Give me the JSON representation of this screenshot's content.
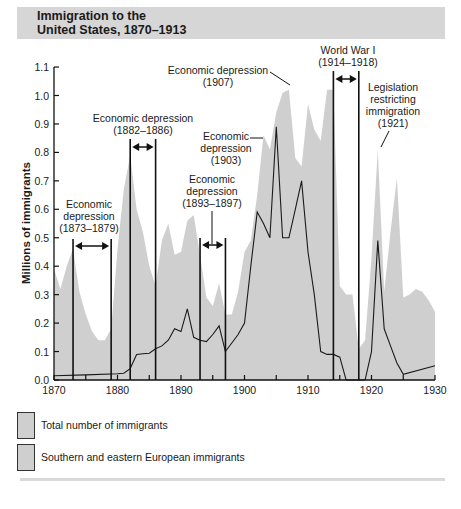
{
  "title": {
    "line1": "Immigration to the",
    "line2": "United States, 1870–1913"
  },
  "colors": {
    "total_fill": "#cfcfcf",
    "title_bar": "#d6d6d6",
    "line": "#1a1a1a"
  },
  "chart_data": {
    "type": "area",
    "title": "Immigration to the United States, 1870–1913",
    "xlabel": "",
    "ylabel": "Millions of immigrants",
    "xlim": [
      1870,
      1930
    ],
    "ylim": [
      0.0,
      1.1
    ],
    "x_ticks": [
      "1870",
      "1880",
      "1890",
      "1900",
      "1910",
      "1920",
      "1930"
    ],
    "y_ticks": [
      "0.0",
      "0.1",
      "0.2",
      "0.3",
      "0.4",
      "0.5",
      "0.6",
      "0.7",
      "0.8",
      "0.9",
      "1.0",
      "1.1"
    ],
    "grid": false,
    "legend_position": "bottom",
    "series": [
      {
        "name": "Total number of immigrants",
        "style": "area",
        "x": [
          1870,
          1871,
          1872,
          1873,
          1874,
          1875,
          1876,
          1877,
          1878,
          1879,
          1880,
          1881,
          1882,
          1883,
          1884,
          1885,
          1886,
          1887,
          1888,
          1889,
          1890,
          1891,
          1892,
          1893,
          1894,
          1895,
          1896,
          1897,
          1898,
          1899,
          1900,
          1901,
          1902,
          1903,
          1904,
          1905,
          1906,
          1907,
          1908,
          1909,
          1910,
          1911,
          1912,
          1913,
          1914,
          1915,
          1916,
          1917,
          1918,
          1919,
          1920,
          1921,
          1922,
          1923,
          1924,
          1925,
          1926,
          1927,
          1928,
          1929,
          1930
        ],
        "values": [
          0.39,
          0.32,
          0.4,
          0.46,
          0.31,
          0.23,
          0.17,
          0.14,
          0.14,
          0.18,
          0.46,
          0.67,
          0.79,
          0.6,
          0.52,
          0.4,
          0.33,
          0.49,
          0.55,
          0.44,
          0.45,
          0.56,
          0.58,
          0.44,
          0.29,
          0.26,
          0.34,
          0.23,
          0.23,
          0.31,
          0.45,
          0.49,
          0.65,
          0.86,
          0.81,
          0.94,
          1.01,
          1.02,
          0.78,
          0.75,
          0.97,
          0.88,
          0.84,
          1.02,
          1.02,
          0.33,
          0.3,
          0.3,
          0.11,
          0.14,
          0.43,
          0.81,
          0.31,
          0.52,
          0.71,
          0.29,
          0.3,
          0.32,
          0.31,
          0.28,
          0.24
        ]
      },
      {
        "name": "Southern and eastern European immigrants",
        "style": "line",
        "x": [
          1870,
          1875,
          1880,
          1881,
          1882,
          1883,
          1884,
          1885,
          1886,
          1887,
          1888,
          1889,
          1890,
          1891,
          1892,
          1893,
          1894,
          1895,
          1896,
          1897,
          1898,
          1899,
          1900,
          1901,
          1902,
          1903,
          1904,
          1905,
          1906,
          1907,
          1908,
          1909,
          1910,
          1911,
          1912,
          1913,
          1914,
          1915,
          1916,
          1917,
          1918,
          1919,
          1920,
          1921,
          1922,
          1923,
          1924,
          1925,
          1930
        ],
        "values": [
          0.015,
          0.018,
          0.022,
          0.024,
          0.04,
          0.09,
          0.092,
          0.094,
          0.11,
          0.12,
          0.14,
          0.18,
          0.17,
          0.25,
          0.15,
          0.14,
          0.135,
          0.16,
          0.19,
          0.1,
          0.13,
          0.16,
          0.2,
          0.4,
          0.59,
          0.55,
          0.5,
          0.89,
          0.5,
          0.5,
          0.6,
          0.7,
          0.45,
          0.3,
          0.1,
          0.09,
          0.09,
          0.08,
          0.0,
          0.0,
          0.0,
          0.0,
          0.1,
          0.49,
          0.18,
          0.12,
          0.06,
          0.02,
          0.05
        ]
      }
    ],
    "annotations": [
      {
        "label": "Economic depression",
        "range": "(1873–1879)",
        "start": 1873,
        "end": 1879
      },
      {
        "label": "Economic depression",
        "range": "(1882–1886)",
        "start": 1882,
        "end": 1886
      },
      {
        "label": "Economic depression",
        "range": "(1893–1897)",
        "start": 1893,
        "end": 1897
      },
      {
        "label": "Economic depression",
        "range": "(1903)",
        "start": 1903
      },
      {
        "label": "Economic depression",
        "range": "(1907)",
        "start": 1907
      },
      {
        "label": "World War I",
        "range": "(1914–1918)",
        "start": 1914,
        "end": 1918
      },
      {
        "label": "Legislation restricting immigration",
        "range": "(1921)",
        "start": 1921
      }
    ]
  },
  "axis": {
    "ylabel": "Millions of immigrants",
    "x_ticks": [
      "1870",
      "1880",
      "1890",
      "1900",
      "1910",
      "1920",
      "1930"
    ],
    "y_ticks": [
      "0.0",
      "0.1",
      "0.2",
      "0.3",
      "0.4",
      "0.5",
      "0.6",
      "0.7",
      "0.8",
      "0.9",
      "1.0",
      "1.1"
    ]
  },
  "annotations": {
    "dep1873": {
      "l1": "Economic",
      "l2": "depression",
      "l3": "(1873–1879)"
    },
    "dep1882": {
      "l1": "Economic depression",
      "l2": "(1882–1886)"
    },
    "dep1893": {
      "l1": "Economic",
      "l2": "depression",
      "l3": "(1893–1897)"
    },
    "dep1903": {
      "l1": "Economic",
      "l2": "depression",
      "l3": "(1903)"
    },
    "dep1907": {
      "l1": "Economic depression",
      "l2": "(1907)"
    },
    "ww1": {
      "l1": "World War I",
      "l2": "(1914–1918)"
    },
    "leg1921": {
      "l1": "Legislation",
      "l2": "restricting",
      "l3": "immigration",
      "l4": "(1921)"
    }
  },
  "legend": {
    "items": [
      {
        "label": "Total number of immigrants"
      },
      {
        "label": "Southern and eastern European immigrants"
      }
    ]
  }
}
